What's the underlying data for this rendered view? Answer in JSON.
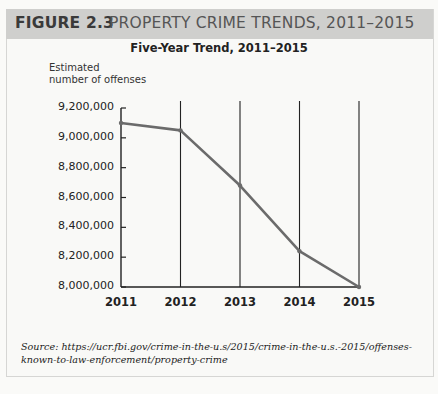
{
  "figure": {
    "number": "FIGURE 2.3",
    "title": "PROPERTY CRIME TRENDS, 2011–2015"
  },
  "chart_data": {
    "type": "line",
    "title": "Five-Year Trend, 2011–2015",
    "xlabel": "",
    "ylabel": "Estimated number of offenses",
    "ylabel_lines": [
      "Estimated",
      "number of offenses"
    ],
    "categories": [
      "2011",
      "2012",
      "2013",
      "2014",
      "2015"
    ],
    "values": [
      9100000,
      9050000,
      8680000,
      8240000,
      8000000
    ],
    "ylim": [
      8000000,
      9200000
    ],
    "yticks": [
      "9,200,000",
      "9,000,000",
      "8,800,000",
      "8,600,000",
      "8,400,000",
      "8,200,000",
      "8,000,000"
    ],
    "grid": "vertical lines at each year",
    "line_color": "#6b6b6b"
  },
  "source": "Source: https://ucr.fbi.gov/crime-in-the-u.s/2015/crime-in-the-u.s.-2015/offenses-known-to-law-enforcement/property-crime"
}
